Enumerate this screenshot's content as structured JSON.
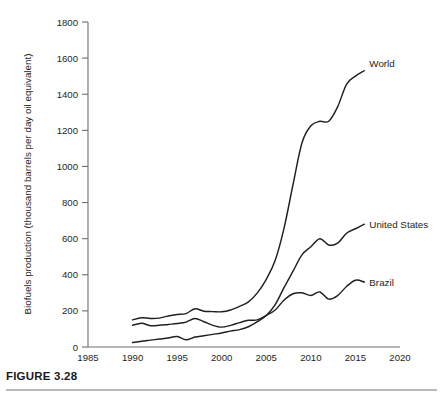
{
  "caption": {
    "label": "FIGURE 3.28"
  },
  "chart_data": {
    "type": "line",
    "title": "",
    "xlabel": "",
    "ylabel": "Biofuels production (thousand barrels per day oil equivalent)",
    "xlim": [
      1985,
      2020
    ],
    "ylim": [
      0,
      1800
    ],
    "xticks": [
      1985,
      1990,
      1995,
      2000,
      2005,
      2010,
      2015,
      2020
    ],
    "yticks": [
      0,
      200,
      400,
      600,
      800,
      1000,
      1200,
      1400,
      1600,
      1800
    ],
    "grid": false,
    "legend_position": "inline-end-of-line",
    "x": [
      1990,
      1991,
      1992,
      1993,
      1994,
      1995,
      1996,
      1997,
      1998,
      1999,
      2000,
      2001,
      2002,
      2003,
      2004,
      2005,
      2006,
      2007,
      2008,
      2009,
      2010,
      2011,
      2012,
      2013,
      2014,
      2015,
      2016
    ],
    "series": [
      {
        "name": "World",
        "label": "World",
        "values": [
          150,
          162,
          158,
          160,
          172,
          180,
          185,
          212,
          198,
          196,
          195,
          205,
          225,
          250,
          300,
          375,
          480,
          660,
          900,
          1130,
          1225,
          1250,
          1250,
          1330,
          1455,
          1500,
          1530
        ]
      },
      {
        "name": "United States",
        "label": "United States",
        "values": [
          25,
          32,
          38,
          44,
          50,
          58,
          40,
          55,
          62,
          70,
          78,
          88,
          96,
          112,
          140,
          175,
          235,
          330,
          420,
          510,
          555,
          600,
          565,
          575,
          630,
          655,
          680
        ]
      },
      {
        "name": "Brazil",
        "label": "Brazil",
        "values": [
          120,
          132,
          118,
          120,
          125,
          130,
          138,
          158,
          140,
          120,
          110,
          120,
          135,
          148,
          150,
          175,
          205,
          260,
          295,
          300,
          285,
          305,
          265,
          285,
          335,
          370,
          360
        ]
      }
    ]
  }
}
